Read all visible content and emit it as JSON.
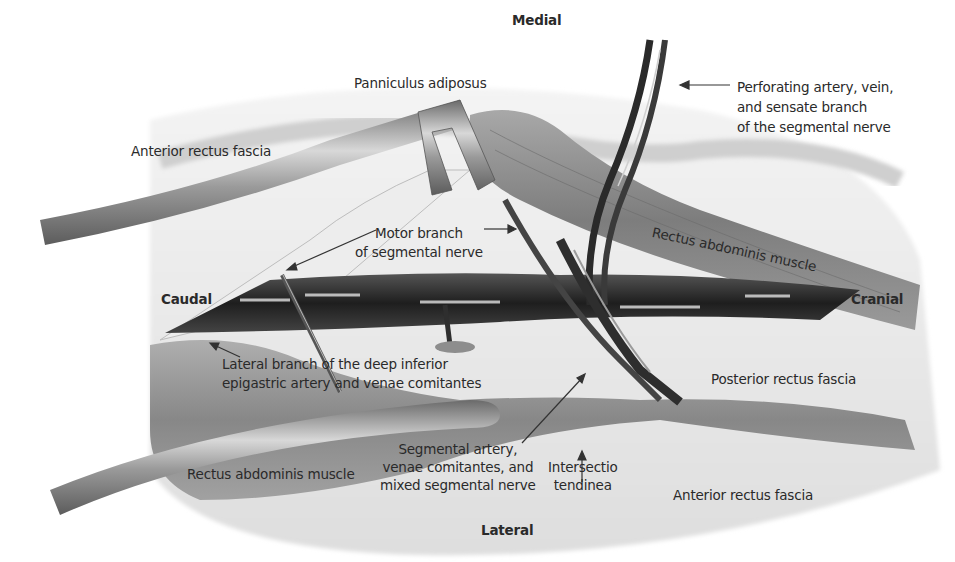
{
  "figure": {
    "type": "surgical anatomical illustration",
    "orientation": {
      "top": "Medial",
      "bottom": "Lateral",
      "left": "Caudal",
      "right": "Cranial"
    },
    "labels": {
      "panniculus": "Panniculus adiposus",
      "anterior_fascia_top": "Anterior rectus fascia",
      "perforating": [
        "Perforating artery, vein,",
        "and sensate branch",
        "of the segmental nerve"
      ],
      "motor_branch": [
        "Motor branch",
        "of segmental nerve"
      ],
      "rectus_upper": "Rectus abdominis muscle",
      "lateral_branch": [
        "Lateral branch of the deep inferior",
        "epigastric artery and venae comitantes"
      ],
      "posterior_fascia": "Posterior rectus fascia",
      "rectus_lower": "Rectus abdominis muscle",
      "segmental": [
        "Segmental artery,",
        "venae comitantes, and",
        "mixed segmental nerve"
      ],
      "intersectio": [
        "Intersectio",
        "tendinea"
      ],
      "anterior_fascia_bottom": "Anterior rectus fascia"
    },
    "colors": {
      "background": "#ffffff",
      "fascia": "#e6e6e6",
      "muscle": "#8a8a8a",
      "retractor": "#9a9a9a",
      "vessel": "#2e2e2e",
      "text": "#2a2a2a"
    }
  }
}
